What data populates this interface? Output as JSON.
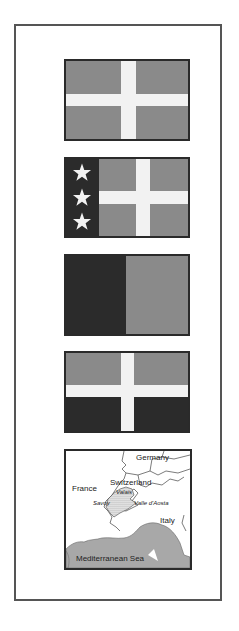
{
  "colors": {
    "frame": "#555555",
    "flag_border": "#2a2a2a",
    "field_gray": "#8a8a8a",
    "field_dark": "#2b2b2b",
    "cross_white": "#f2f2f2",
    "sea_gray": "#a8a8a8"
  },
  "flags": [
    {
      "id": "flag-1",
      "description": "gray field with white cross",
      "icon": "cross-flag-icon"
    },
    {
      "id": "flag-2",
      "description": "dark hoist with three white stars, gray field with white cross",
      "icon": "three-stars-cross-flag-icon",
      "star_count": 3
    },
    {
      "id": "flag-3",
      "description": "vertical bicolor dark and gray",
      "icon": "bicolor-flag-icon"
    },
    {
      "id": "flag-4",
      "description": "horizontal gray over dark with white cross",
      "icon": "cross-bicolor-flag-icon"
    }
  ],
  "map": {
    "labels": {
      "germany": "Germany",
      "france": "France",
      "switzerland": "Switzerland",
      "valais": "Valais",
      "savoy": "Savoy",
      "aosta": "Valle d'Aosta",
      "italy": "Italy",
      "sea": "Mediterranean Sea"
    }
  }
}
